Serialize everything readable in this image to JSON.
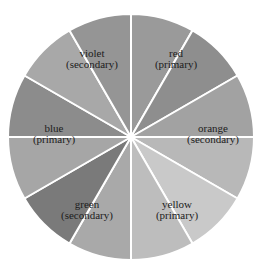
{
  "diagram": {
    "type": "color-wheel",
    "center": [
      131,
      137
    ],
    "radius": 123,
    "segments": [
      {
        "shade": "#9a9a9a"
      },
      {
        "shade": "#8e8e8e"
      },
      {
        "shade": "#a2a2a2"
      },
      {
        "shade": "#b8b8b8"
      },
      {
        "shade": "#c9c9c9"
      },
      {
        "shade": "#bdbdbd"
      },
      {
        "shade": "#a9a9a9"
      },
      {
        "shade": "#7a7a7a"
      },
      {
        "shade": "#a6a6a6"
      },
      {
        "shade": "#8c8c8c"
      },
      {
        "shade": "#a8a8a8"
      },
      {
        "shade": "#959595"
      }
    ],
    "labels": [
      {
        "name": "red",
        "role": "(primary)",
        "x": 176,
        "y": 53
      },
      {
        "name": "orange",
        "role": "(secondary)",
        "x": 213,
        "y": 126
      },
      {
        "name": "yellow",
        "role": "(primary)",
        "x": 178,
        "y": 203
      },
      {
        "name": "green",
        "role": "(secondary)",
        "x": 86,
        "y": 203
      },
      {
        "name": "blue",
        "role": "(primary)",
        "x": 55,
        "y": 126
      },
      {
        "name": "violet",
        "role": "(secondary)",
        "x": 92,
        "y": 53
      }
    ]
  }
}
